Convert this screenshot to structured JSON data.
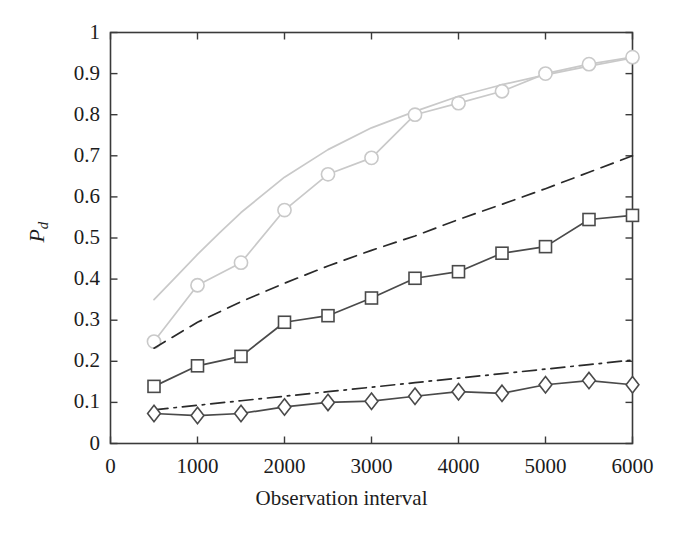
{
  "chart_data": {
    "type": "line",
    "title": "",
    "xlabel": "Observation interval",
    "ylabel": "Pd",
    "ylabel_base": "P",
    "ylabel_sub": "d",
    "xlim": [
      0,
      6000
    ],
    "ylim": [
      0,
      1
    ],
    "xticks": [
      0,
      1000,
      2000,
      3000,
      4000,
      5000,
      6000
    ],
    "xtick_labels": [
      "0",
      "1000",
      "2000",
      "3000",
      "4000",
      "5000",
      "6000"
    ],
    "yticks": [
      0,
      0.1,
      0.2,
      0.3,
      0.4,
      0.5,
      0.6,
      0.7,
      0.8,
      0.9,
      1
    ],
    "ytick_labels": [
      "0",
      "0.1",
      "0.2",
      "0.3",
      "0.4",
      "0.5",
      "0.6",
      "0.7",
      "0.8",
      "0.9",
      "1"
    ],
    "grid": false,
    "legend": "none",
    "series": [
      {
        "name": "light-solid-upper-bound",
        "style": "solid",
        "marker": "none",
        "color": "#c9c9c9",
        "x": [
          500,
          750,
          1000,
          1250,
          1500,
          2000,
          2500,
          3000,
          3500,
          4000,
          4500,
          5000,
          5500,
          6000
        ],
        "values": [
          0.35,
          0.405,
          0.46,
          0.512,
          0.562,
          0.648,
          0.715,
          0.768,
          0.808,
          0.845,
          0.873,
          0.897,
          0.918,
          0.938
        ]
      },
      {
        "name": "light-circle-markers",
        "style": "solid",
        "marker": "circle",
        "color": "#c9c9c9",
        "x": [
          500,
          1000,
          1500,
          2000,
          2500,
          3000,
          3500,
          4000,
          4500,
          5000,
          5500,
          6000
        ],
        "values": [
          0.248,
          0.385,
          0.44,
          0.568,
          0.655,
          0.695,
          0.8,
          0.828,
          0.857,
          0.9,
          0.923,
          0.94
        ]
      },
      {
        "name": "dark-dashed-bound",
        "style": "dashed",
        "marker": "none",
        "color": "#2a2a2a",
        "x": [
          500,
          1000,
          1500,
          2000,
          2500,
          3000,
          3500,
          4000,
          4500,
          5000,
          5500,
          6000
        ],
        "values": [
          0.232,
          0.295,
          0.345,
          0.39,
          0.432,
          0.47,
          0.505,
          0.545,
          0.582,
          0.62,
          0.66,
          0.7
        ]
      },
      {
        "name": "dark-square-markers",
        "style": "solid",
        "marker": "square",
        "color": "#4a4a4a",
        "x": [
          500,
          1000,
          1500,
          2000,
          2500,
          3000,
          3500,
          4000,
          4500,
          5000,
          5500,
          6000
        ],
        "values": [
          0.139,
          0.189,
          0.212,
          0.295,
          0.311,
          0.354,
          0.402,
          0.418,
          0.463,
          0.479,
          0.545,
          0.555
        ]
      },
      {
        "name": "dark-dashdot-bound",
        "style": "dashdot",
        "marker": "none",
        "color": "#2a2a2a",
        "x": [
          500,
          1000,
          1500,
          2000,
          2500,
          3000,
          3500,
          4000,
          4500,
          5000,
          5500,
          6000
        ],
        "values": [
          0.082,
          0.093,
          0.104,
          0.115,
          0.126,
          0.137,
          0.148,
          0.159,
          0.17,
          0.181,
          0.192,
          0.203
        ]
      },
      {
        "name": "dark-diamond-markers",
        "style": "solid",
        "marker": "diamond",
        "color": "#4a4a4a",
        "x": [
          500,
          1000,
          1500,
          2000,
          2500,
          3000,
          3500,
          4000,
          4500,
          5000,
          5500,
          6000
        ],
        "values": [
          0.073,
          0.068,
          0.073,
          0.089,
          0.1,
          0.103,
          0.115,
          0.126,
          0.122,
          0.143,
          0.153,
          0.143
        ]
      }
    ]
  },
  "axes": {
    "frame_color": "#3a3a3a",
    "tick_color": "#3a3a3a"
  }
}
